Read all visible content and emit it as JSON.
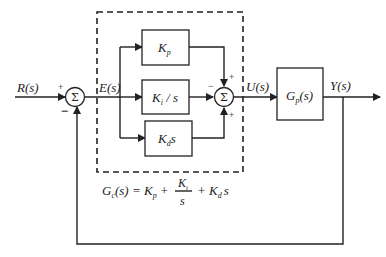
{
  "diagram": {
    "type": "pid-control-block-diagram",
    "input_label": "R(s)",
    "error_label": "E(s)",
    "control_label": "U(s)",
    "output_label": "Y(s)",
    "sum_symbol": "Σ",
    "left_junction": {
      "top_sign": "+",
      "bottom_sign": "−"
    },
    "right_junction": {
      "left_sign": "−",
      "top_sign": "+",
      "bottom_sign": "+"
    },
    "blocks": {
      "kp": {
        "main": "K",
        "sub": "p"
      },
      "ki": {
        "main": "K",
        "sub": "i",
        "suffix": " / s"
      },
      "kd": {
        "main": "K",
        "sub": "d",
        "suffix": "s"
      },
      "plant": {
        "main": "G",
        "sub": "p",
        "suffix": "(s)"
      }
    },
    "formula": {
      "lhs_main": "G",
      "lhs_sub": "c",
      "lhs_rest": "(s) = K",
      "kp_sub": "p",
      "plus1": "+",
      "frac_num_main": "K",
      "frac_num_sub": "i",
      "frac_den": "s",
      "plus2": "+ K",
      "kd_sub": "d",
      "kd_s": "s"
    },
    "colors": {
      "line": "#222222",
      "background": "#ffffff"
    }
  }
}
